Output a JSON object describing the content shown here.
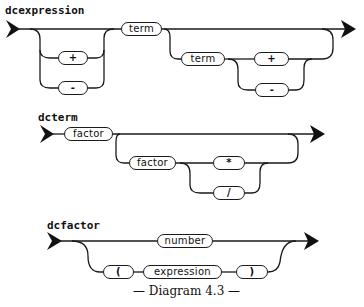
{
  "diagram": {
    "type": "syntax-railroad",
    "caption": "— Diagram 4.3 —",
    "rules": [
      {
        "name": "dcexpression",
        "nodes": {
          "plus_optional": "+",
          "minus_optional": "-",
          "term_first": "term",
          "term_repeat": "term",
          "plus_repeat": "+",
          "minus_repeat": "-"
        }
      },
      {
        "name": "dcterm",
        "nodes": {
          "factor_first": "factor",
          "factor_repeat": "factor",
          "times_repeat": "*",
          "divide_repeat": "/"
        }
      },
      {
        "name": "dcfactor",
        "nodes": {
          "number": "number",
          "lparen": "(",
          "expression": "expression",
          "rparen": ")"
        }
      }
    ]
  }
}
